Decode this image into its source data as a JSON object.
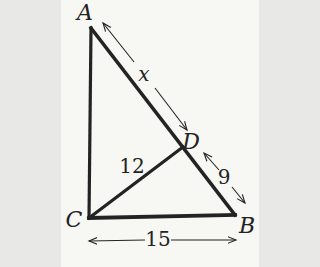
{
  "figure": {
    "background": "#f7f7f4",
    "ink": "#232323",
    "vertices": {
      "A": {
        "x": 30,
        "y": 28
      },
      "B": {
        "x": 174,
        "y": 215
      },
      "C": {
        "x": 28,
        "y": 218
      },
      "D": {
        "x": 122,
        "y": 147
      }
    },
    "sides": [
      {
        "name": "side-AB",
        "from": "A",
        "to": "B",
        "width": 3.5
      },
      {
        "name": "side-AC",
        "from": "A",
        "to": "C",
        "width": 3.2
      },
      {
        "name": "side-CB",
        "from": "C",
        "to": "B",
        "width": 3.8
      },
      {
        "name": "cevian-CD",
        "from": "C",
        "to": "D",
        "width": 3.2
      }
    ],
    "dimension_arrows": [
      {
        "name": "dim-AD",
        "width": 1.1,
        "segments": [
          {
            "x1": 42,
            "y1": 23,
            "x2": 73,
            "y2": 62,
            "head": "start"
          },
          {
            "x1": 94,
            "y1": 88,
            "x2": 126,
            "y2": 130,
            "head": "end"
          }
        ]
      },
      {
        "name": "dim-DB",
        "width": 1.1,
        "segments": [
          {
            "x1": 143,
            "y1": 153,
            "x2": 158,
            "y2": 170,
            "head": "start"
          },
          {
            "x1": 171,
            "y1": 187,
            "x2": 184,
            "y2": 203,
            "head": "end"
          }
        ]
      },
      {
        "name": "dim-CB",
        "width": 1.1,
        "segments": [
          {
            "x1": 28,
            "y1": 241,
            "x2": 84,
            "y2": 240,
            "head": "start"
          },
          {
            "x1": 110,
            "y1": 240,
            "x2": 175,
            "y2": 240,
            "head": "end"
          }
        ]
      }
    ],
    "vertex_labels": [
      {
        "text": "A",
        "x": 24,
        "y": 13
      },
      {
        "text": "B",
        "x": 186,
        "y": 226
      },
      {
        "text": "C",
        "x": 13,
        "y": 220
      },
      {
        "text": "D",
        "x": 130,
        "y": 142
      }
    ],
    "measure_labels": [
      {
        "text": "x",
        "x": 83,
        "y": 74,
        "italic": true
      },
      {
        "text": "9",
        "x": 163,
        "y": 177,
        "italic": false
      },
      {
        "text": "12",
        "x": 71,
        "y": 166,
        "italic": false
      },
      {
        "text": "15",
        "x": 97,
        "y": 239,
        "italic": false
      }
    ]
  }
}
